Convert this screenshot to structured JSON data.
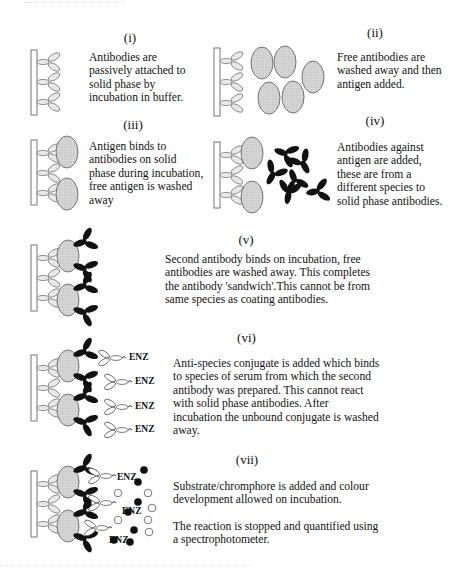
{
  "top_fragment": "",
  "steps": [
    {
      "label": "(i)",
      "text": [
        "Antibodies are",
        "passively attached to",
        "solid phase by",
        "incubation in buffer."
      ]
    },
    {
      "label": "(ii)",
      "text": [
        "Free antibodies are",
        "washed away and then",
        "antigen added."
      ]
    },
    {
      "label": "(iii)",
      "text": [
        "Antigen binds to",
        "antibodies on solid",
        "phase during incubation,",
        "free antigen is washed",
        "away"
      ]
    },
    {
      "label": "(iv)",
      "text": [
        "Antibodies against",
        "antigen are added,",
        "these are from a",
        "different species to",
        "solid phase antibodies."
      ]
    },
    {
      "label": "(v)",
      "text": [
        "Second antibody binds on incubation, free",
        "antibodies are washed away. This completes",
        "the antibody 'sandwich'.This cannot be from",
        "same species as coating antibodies."
      ]
    },
    {
      "label": "(vi)",
      "text": [
        "Anti-species conjugate is added which binds",
        "to species of serum from  which the  second",
        "antibody was prepared. This cannot react",
        "with solid phase antibodies. After",
        "incubation the unbound conjugate is washed",
        "away."
      ]
    },
    {
      "label": "(vii)",
      "text": [
        "Substrate/chromphore is added and colour",
        "development allowed on incubation.",
        "",
        "The reaction is stopped and quantified using",
        "a spectrophotometer."
      ]
    }
  ],
  "enzyme_label": "ENZ",
  "colors": {
    "antigen_fill": "#d0d0d0",
    "second_antibody": "#111111",
    "outline": "#666666"
  }
}
